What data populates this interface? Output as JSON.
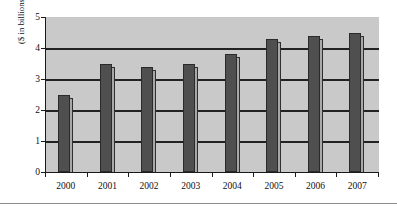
{
  "chart_data": {
    "type": "bar",
    "title": "",
    "xlabel": "",
    "ylabel": "($ in billions)",
    "categories": [
      "2000",
      "2001",
      "2002",
      "2003",
      "2004",
      "2005",
      "2006",
      "2007"
    ],
    "values": [
      2.5,
      3.5,
      3.4,
      3.5,
      3.8,
      4.3,
      4.4,
      4.5
    ],
    "ylim": [
      0,
      5
    ],
    "ytick_labels": [
      "5",
      "4",
      "3",
      "2",
      "1",
      "0"
    ],
    "ytick_values": [
      5,
      4,
      3,
      2,
      1,
      0
    ],
    "grid": true,
    "grid_axis": "y",
    "legend": false,
    "legend_position": "none",
    "series": [
      {
        "name": "",
        "values": [
          2.5,
          3.5,
          3.4,
          3.5,
          3.8,
          4.3,
          4.4,
          4.5
        ]
      }
    ]
  },
  "colors": {
    "bar_fill": "#4f4f4f",
    "bar_border": "#2a2a2a",
    "bar_shadow": "#a8a8a8",
    "plot_background": "#c9c9c9",
    "gridline": "#222222",
    "axis": "#1a1a1a",
    "page_background": "#ffffff"
  }
}
